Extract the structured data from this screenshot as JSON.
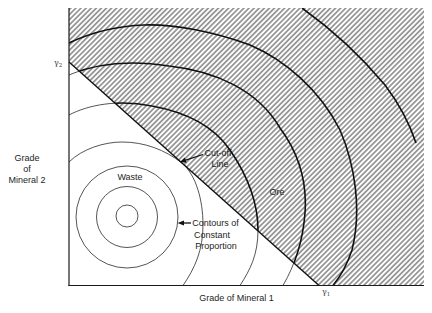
{
  "figure": {
    "axes": {
      "x_label": "Grade of Mineral 1",
      "y_label": [
        "Grade",
        "of",
        "Mineral 2"
      ]
    },
    "markers": {
      "gamma1": {
        "symbol": "γ",
        "subscript": "1"
      },
      "gamma2": {
        "symbol": "γ",
        "subscript": "2"
      }
    },
    "regions": {
      "waste_label": "Waste",
      "ore_label": "Ore"
    },
    "annotations": {
      "cutoff_line": [
        "Cut-off",
        "Line"
      ],
      "contours": [
        "Contours of",
        "Constant",
        "Proportion"
      ]
    },
    "colors": {
      "line": "#111111",
      "hatch": "#555555",
      "background": "#ffffff"
    }
  }
}
